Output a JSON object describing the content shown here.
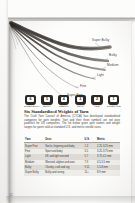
{
  "document": {
    "page_number": "12"
  },
  "figure": {
    "name": "yarn-weight-strands",
    "labels": [
      {
        "text": "Super Bulky",
        "x": 83,
        "y": 20
      },
      {
        "text": "Bulky",
        "x": 100,
        "y": 35
      },
      {
        "text": "Medium",
        "x": 98,
        "y": 44
      },
      {
        "text": "Light",
        "x": 88,
        "y": 54
      },
      {
        "text": "Fine",
        "x": 70,
        "y": 65
      },
      {
        "text": "Super Fine",
        "x": 56,
        "y": 74
      }
    ]
  },
  "symbols": [
    {
      "number": "6",
      "caption": "SUPER BULKY"
    },
    {
      "number": "5",
      "caption": "BULKY"
    },
    {
      "number": "4",
      "caption": "MEDIUM"
    },
    {
      "number": "3",
      "caption": "LIGHT"
    },
    {
      "number": "2",
      "caption": "FINE"
    },
    {
      "number": "1",
      "caption": "SUPER FINE"
    }
  ],
  "article": {
    "heading": "Six Standardized Weights of Yarn",
    "body": "The Craft Yarn Council of America (CYCA) has developed standardized categories for yarn weights. Yarn and their three symbols are not pure yardstick for US companies. The list below gives yarn names and weight ranges for yarns sold as standard U.S. and metric needle sizes."
  },
  "table": {
    "columns": [
      "Yarn",
      "Uses",
      "U.S.",
      "Metric"
    ],
    "rows": [
      [
        "Super Fine",
        "Socks, fingering and baby",
        "1-3",
        "2.25-3.25 mm"
      ],
      [
        "Fine",
        "Sport and baby",
        "3-5",
        "3.25-3.75 mm"
      ],
      [
        "Light",
        "DK and light worsted",
        "5-7",
        "3.75-4.5 mm"
      ],
      [
        "Medium",
        "Worsted, afghan and aran",
        "7-9",
        "4.5-5.5 mm"
      ],
      [
        "Bulky",
        "Chunky, craft and rug",
        "9-11",
        "5.5-8 mm"
      ],
      [
        "Super Bulky",
        "Bulky and roving",
        "11+",
        "8-9 mm"
      ]
    ]
  },
  "colors": {
    "paper": "#fdfdfc",
    "ink": "#262220",
    "row_odd": "#dedbd6",
    "row_even": "#efedea",
    "symbol": "#2b2724"
  }
}
